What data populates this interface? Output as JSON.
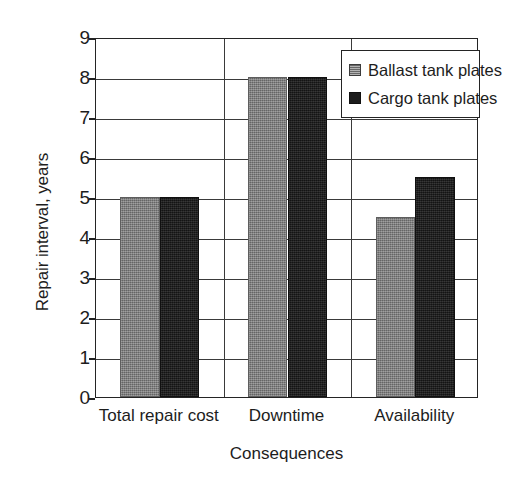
{
  "chart_data": {
    "type": "bar",
    "title": "",
    "xlabel": "Consequences",
    "ylabel": "Repair interval, years",
    "categories": [
      "Total repair cost",
      "Downtime",
      "Availability"
    ],
    "series": [
      {
        "name": "Ballast tank plates",
        "values": [
          5,
          8,
          4.5
        ],
        "color": "#7c7c7c"
      },
      {
        "name": "Cargo tank plates",
        "values": [
          5,
          8,
          5.5
        ],
        "color": "#1c1c1c"
      }
    ],
    "ylim": [
      0,
      9
    ],
    "yticks": [
      0,
      1,
      2,
      3,
      4,
      5,
      6,
      7,
      8,
      9
    ],
    "ytick_labels": [
      "0",
      "1",
      "2",
      "3",
      "4",
      "5",
      "6",
      "7",
      "8",
      "9"
    ],
    "grid": true,
    "grid_axis": "both",
    "legend_position": "top-right",
    "legend_entries": [
      "Ballast tank plates",
      "Cargo tank plates"
    ]
  }
}
